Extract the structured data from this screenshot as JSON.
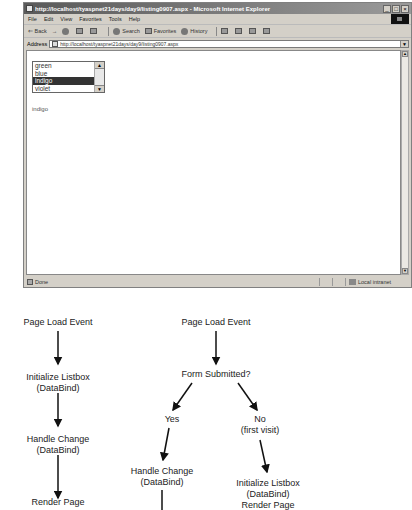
{
  "browser": {
    "title": "http://localhost/tyaspnet21days/day9/listing0907.aspx - Microsoft Internet Explorer",
    "window_buttons": [
      "_",
      "□",
      "×"
    ],
    "menu": [
      "File",
      "Edit",
      "View",
      "Favorites",
      "Tools",
      "Help"
    ],
    "toolbar": {
      "back": "⇐ Back",
      "forward": "→",
      "search": "Search",
      "favorites": "Favorites",
      "history": "History"
    },
    "address_label": "Address",
    "address_url": "http://localhost/tyaspnet21days/day9/listing0907.aspx",
    "listbox": {
      "options": [
        "green",
        "blue",
        "indigo",
        "violet"
      ],
      "selected": "indigo"
    },
    "result_text": "indigo",
    "status": {
      "text": "Done",
      "zone": "Local intranet"
    }
  },
  "diagram": {
    "left_flow": {
      "n1": "Page Load Event",
      "n2a": "Initialize Listbox",
      "n2b": "(DataBind)",
      "n3a": "Handle Change",
      "n3b": "(DataBind)",
      "n4": "Render Page"
    },
    "right_flow": {
      "n1": "Page Load Event",
      "n2": "Form Submitted?",
      "yes": "Yes",
      "no_a": "No",
      "no_b": "(first visit)",
      "hc_a": "Handle Change",
      "hc_b": "(DataBind)",
      "init_a": "Initialize Listbox",
      "init_b": "(DataBind)",
      "init_c": "Render Page"
    }
  }
}
